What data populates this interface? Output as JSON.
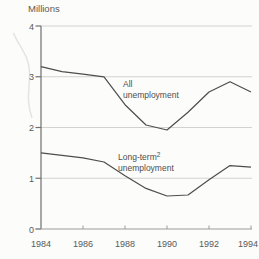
{
  "unit_label": "Millions",
  "chart_data": {
    "type": "line",
    "title": "Millions",
    "x": [
      1984,
      1985,
      1986,
      1987,
      1988,
      1989,
      1990,
      1991,
      1992,
      1993,
      1994
    ],
    "series": [
      {
        "name": "All unemployment",
        "values": [
          3.2,
          3.1,
          3.05,
          3.0,
          2.45,
          2.05,
          1.95,
          2.3,
          2.7,
          2.9,
          2.7
        ]
      },
      {
        "name": "Long-term unemployment",
        "values": [
          1.5,
          1.45,
          1.4,
          1.32,
          1.05,
          0.8,
          0.65,
          0.67,
          0.97,
          1.25,
          1.22
        ]
      }
    ],
    "xlim": [
      1984,
      1994
    ],
    "ylim": [
      0,
      4
    ],
    "xtick_labels": [
      "1984",
      "1986",
      "1988",
      "1990",
      "1992",
      "1994"
    ],
    "xtick_years": [
      1984,
      1986,
      1988,
      1990,
      1992,
      1994
    ],
    "ytick_labels": [
      "0",
      "1",
      "2",
      "3",
      "4"
    ],
    "ytick_values": [
      0,
      1,
      2,
      3,
      4
    ],
    "grid": "horizontal gridlines at 1, 2, 3, 4",
    "legend_position": "inline labels on plot"
  },
  "series_labels": {
    "all_line1": "All",
    "all_line2": "unemployment",
    "longterm_line1": "Long-term",
    "longterm_superscript": "2",
    "longterm_line2": "unemployment"
  },
  "colors": {
    "line": "#4d4d4d",
    "grid": "#d2d2ce",
    "y_axis": "#6e6e6e",
    "x_axis": "#9c9c9c",
    "text": "#595959",
    "background": "#fcfcfb",
    "decorative_curve": "#e4e4e0"
  }
}
